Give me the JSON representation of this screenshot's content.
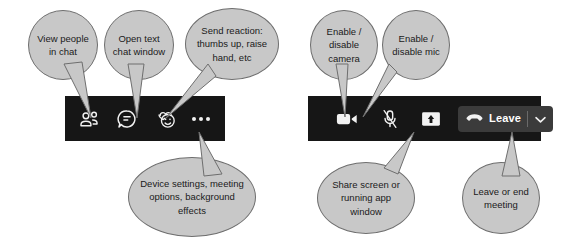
{
  "diagram": {
    "bubble_fill": "#c8c8c8",
    "bubble_stroke": "#6e6e6e",
    "toolbar_bg": "#161616",
    "icon_color": "#f2f2f2",
    "leave_button_bg": "#3b3b3b"
  },
  "left_toolbar": {
    "name": "meeting-toolbar-left",
    "buttons": [
      {
        "id": "people",
        "icon": "people-icon",
        "label": "Show participants"
      },
      {
        "id": "chat",
        "icon": "chat-bubble-icon",
        "label": "Show conversation"
      },
      {
        "id": "reactions",
        "icon": "reactions-icon",
        "label": "Reactions"
      },
      {
        "id": "more",
        "icon": "more-options-icon",
        "label": "More actions"
      }
    ]
  },
  "right_toolbar": {
    "name": "meeting-toolbar-right",
    "buttons": [
      {
        "id": "camera",
        "icon": "camera-icon",
        "label": "Camera"
      },
      {
        "id": "mic",
        "icon": "microphone-muted-icon",
        "label": "Mic"
      },
      {
        "id": "share",
        "icon": "share-screen-icon",
        "label": "Share"
      }
    ],
    "leave": {
      "icon": "hangup-phone-icon",
      "label": "Leave",
      "chevron": "chevron-down-icon"
    }
  },
  "callouts": [
    {
      "id": "view-people",
      "text": "View people in chat"
    },
    {
      "id": "open-chat",
      "text": "Open text chat window"
    },
    {
      "id": "send-reaction",
      "text": "Send reaction: thumbs up, raise hand, etc"
    },
    {
      "id": "enable-camera",
      "text": "Enable / disable camera"
    },
    {
      "id": "enable-mic",
      "text": "Enable / disable mic"
    },
    {
      "id": "device-settings",
      "text": "Device settings, meeting options, background effects"
    },
    {
      "id": "share-screen",
      "text": "Share screen or running app window"
    },
    {
      "id": "leave-meeting",
      "text": "Leave or end meeting"
    }
  ]
}
